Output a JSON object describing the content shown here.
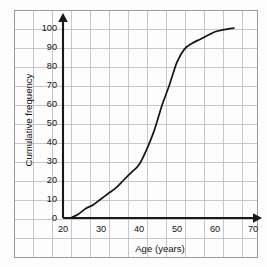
{
  "chart_data": {
    "type": "line",
    "title": "",
    "subtitle": "",
    "xlabel": "Age (years)",
    "ylabel": "Cumulative frequency",
    "xlim": [
      20,
      75
    ],
    "ylim": [
      0,
      105
    ],
    "xticks": [
      20,
      30,
      40,
      50,
      60,
      70
    ],
    "xtick_labels": [
      "20",
      "30",
      "40",
      "50",
      "60",
      "70"
    ],
    "yticks": [
      0,
      10,
      20,
      30,
      40,
      50,
      60,
      70,
      80,
      90,
      100
    ],
    "ytick_labels": [
      "0",
      "10",
      "20",
      "30",
      "40",
      "50",
      "60",
      "70",
      "80",
      "90",
      "100"
    ],
    "grid": true,
    "grid_color": "#b9b9bd",
    "legend": false,
    "legend_position": "none",
    "line_color": "#141414",
    "series": [
      {
        "name": "Cumulative frequency",
        "x": [
          22,
          24,
          26,
          28,
          30,
          32,
          34,
          36,
          38,
          40,
          42,
          44,
          46,
          48,
          50,
          52,
          54,
          56,
          58,
          60,
          62,
          65
        ],
        "values": [
          0,
          2,
          5,
          7,
          10,
          13,
          16,
          20,
          24,
          28,
          36,
          46,
          59,
          70,
          82,
          89,
          92,
          94,
          96,
          98,
          99,
          100
        ]
      }
    ],
    "annotations": []
  },
  "axis": {
    "x_label": "Age (years)",
    "y_label": "Cumulative frequency"
  }
}
